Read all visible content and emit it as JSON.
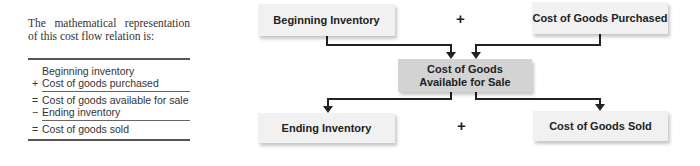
{
  "intro_text": "The mathematical representation of this cost flow relation is:",
  "equation": [
    {
      "op": "",
      "label": "Beginning inventory"
    },
    {
      "op": "+",
      "label": "Cost of goods purchased"
    },
    {
      "op": "=",
      "label": "Cost of goods available for sale"
    },
    {
      "op": "−",
      "label": "Ending inventory"
    },
    {
      "op": "=",
      "label": "Cost of goods sold"
    }
  ],
  "diagram": {
    "top_left": "Beginning Inventory",
    "top_right": "Cost of Goods Purchased",
    "top_operator": "+",
    "middle_line1": "Cost of Goods",
    "middle_line2": "Available for Sale",
    "bottom_left": "Ending Inventory",
    "bottom_right": "Cost of Goods Sold",
    "bottom_operator": "+"
  },
  "colors": {
    "box": "#f1f1f1",
    "middle_box": "#d3d3d3",
    "arrow": "#222222"
  }
}
